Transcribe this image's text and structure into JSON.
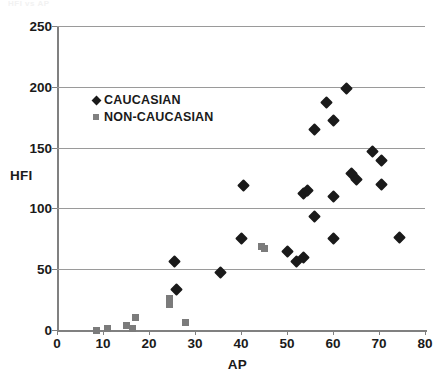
{
  "figure": {
    "top_fragment_text": "HFI vs AP",
    "axis_title_y": "HFI",
    "axis_title_x": "AP"
  },
  "legend": {
    "items": [
      {
        "label": "CAUCASIAN",
        "marker": "diamond-icon",
        "color": "#1a1a1a"
      },
      {
        "label": "NON-CAUCASIAN",
        "marker": "square-icon",
        "color": "#808080"
      }
    ]
  },
  "axes": {
    "x_ticks": [
      "0",
      "10",
      "20",
      "30",
      "40",
      "50",
      "60",
      "70",
      "80"
    ],
    "y_ticks": [
      "0",
      "50",
      "100",
      "150",
      "200",
      "250"
    ]
  },
  "chart_data": {
    "type": "scatter",
    "title": "",
    "xlabel": "AP",
    "ylabel": "HFI",
    "xlim": [
      0,
      80
    ],
    "ylim": [
      0,
      250
    ],
    "xticks": [
      0,
      10,
      20,
      30,
      40,
      50,
      60,
      70,
      80
    ],
    "yticks": [
      0,
      50,
      100,
      150,
      200,
      250
    ],
    "grid": "horizontal",
    "legend_position": "upper-left-inside",
    "series": [
      {
        "name": "CAUCASIAN",
        "marker": "diamond",
        "color": "#1a1a1a",
        "points": [
          [
            25.5,
            56
          ],
          [
            26.0,
            33
          ],
          [
            35.5,
            47.5
          ],
          [
            40.0,
            75
          ],
          [
            40.5,
            119
          ],
          [
            50.0,
            64.5
          ],
          [
            52.0,
            56
          ],
          [
            53.5,
            60
          ],
          [
            53.5,
            112
          ],
          [
            54.5,
            115
          ],
          [
            56.0,
            93
          ],
          [
            56.0,
            165
          ],
          [
            58.5,
            187
          ],
          [
            60.0,
            75
          ],
          [
            60.0,
            110
          ],
          [
            60.0,
            172
          ],
          [
            63.0,
            199
          ],
          [
            64.0,
            129
          ],
          [
            65.0,
            124
          ],
          [
            68.5,
            147
          ],
          [
            70.5,
            139
          ],
          [
            70.5,
            120
          ],
          [
            74.5,
            76
          ]
        ]
      },
      {
        "name": "NON-CAUCASIAN",
        "marker": "square",
        "color": "#7b7b7b",
        "points": [
          [
            8.5,
            0
          ],
          [
            11.0,
            1.5
          ],
          [
            15.0,
            4
          ],
          [
            16.5,
            1
          ],
          [
            17.0,
            10
          ],
          [
            24.5,
            26
          ],
          [
            24.5,
            21
          ],
          [
            28.0,
            6
          ],
          [
            44.5,
            69
          ],
          [
            45.0,
            67
          ]
        ]
      }
    ]
  }
}
